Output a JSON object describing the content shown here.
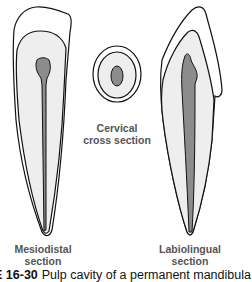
{
  "figure": {
    "caption_number": "E 16-30",
    "caption_text": "Pulp cavity of a permanent mandibula",
    "colors": {
      "outline": "#111111",
      "dentin_fill": "#eeeeee",
      "enamel_fill": "#ffffff",
      "pulp_fill": "#8c8c8c",
      "label_text": "#555555"
    },
    "labels": {
      "mesiodistal": [
        "Mesiodistal",
        "section"
      ],
      "cervical": [
        "Cervical",
        "cross section"
      ],
      "labiolingual": [
        "Labiolingual",
        "section"
      ]
    }
  }
}
